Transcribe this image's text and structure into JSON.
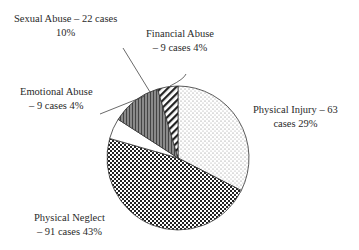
{
  "chart_data": {
    "type": "pie",
    "title": "",
    "start_angle_deg": 0,
    "direction": "clockwise",
    "slices": [
      {
        "label": "Physical Injury",
        "cases": 63,
        "percent": 29,
        "pattern": "dots",
        "label_text": [
          "Physical Injury – 63",
          "cases 29%"
        ]
      },
      {
        "label": "Physical Neglect",
        "cases": 91,
        "percent": 43,
        "pattern": "checker",
        "label_text": [
          "Physical Neglect",
          "– 91 cases 43%"
        ]
      },
      {
        "label": "Emotional Abuse",
        "cases": 9,
        "percent": 4,
        "pattern": "white",
        "label_text": [
          "Emotional Abuse",
          "– 9 cases 4%"
        ]
      },
      {
        "label": "Sexual Abuse",
        "cases": 22,
        "percent": 10,
        "pattern": "vertical-stripes",
        "label_text": [
          "Sexual Abuse – 22 cases",
          "10%"
        ]
      },
      {
        "label": "Financial Abuse",
        "cases": 9,
        "percent": 4,
        "pattern": "diagonal-stripes",
        "label_text": [
          "Financial Abuse",
          "– 9 cases 4%"
        ]
      }
    ],
    "legend": "none (callout labels)",
    "categories": [
      "Physical Injury",
      "Physical Neglect",
      "Emotional Abuse",
      "Sexual Abuse",
      "Financial Abuse"
    ],
    "values": [
      63,
      91,
      9,
      22,
      9
    ],
    "percentages": [
      29,
      43,
      4,
      10,
      4
    ]
  },
  "labels": {
    "physical_injury": {
      "line1": "Physical Injury – 63",
      "line2": "cases 29%"
    },
    "physical_neglect": {
      "line1": "Physical Neglect",
      "line2": "– 91 cases 43%"
    },
    "emotional_abuse": {
      "line1": "Emotional Abuse",
      "line2": "– 9 cases 4%"
    },
    "sexual_abuse": {
      "line1": "Sexual Abuse – 22 cases",
      "line2": "10%"
    },
    "financial_abuse": {
      "line1": "Financial Abuse",
      "line2": "– 9 cases 4%"
    }
  }
}
